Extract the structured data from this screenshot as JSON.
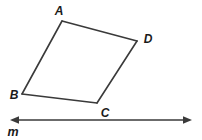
{
  "figure": {
    "type": "geometry-diagram",
    "background_color": "#ffffff",
    "stroke_color": "#3a3a3a",
    "label_color": "#1a1a1a",
    "quadrilateral": {
      "name": "quadrilateral-ABCD",
      "vertex_order": [
        "A",
        "B",
        "C",
        "D"
      ],
      "vertices": [
        {
          "id": "A",
          "label": "A",
          "x": 62,
          "y": 21,
          "label_x": 59,
          "label_y": 15,
          "label_anchor": "middle"
        },
        {
          "id": "B",
          "label": "B",
          "x": 22,
          "y": 94,
          "label_x": 14,
          "label_y": 99,
          "label_anchor": "middle"
        },
        {
          "id": "C",
          "label": "C",
          "x": 97,
          "y": 103,
          "label_x": 105,
          "label_y": 117,
          "label_anchor": "middle"
        },
        {
          "id": "D",
          "label": "D",
          "x": 137,
          "y": 41,
          "label_x": 148,
          "label_y": 43,
          "label_anchor": "middle"
        }
      ],
      "edges": [
        {
          "id": "AD",
          "from": "A",
          "to": "D"
        },
        {
          "id": "DC",
          "from": "D",
          "to": "C"
        },
        {
          "id": "CB",
          "from": "C",
          "to": "B"
        },
        {
          "id": "BA",
          "from": "B",
          "to": "A"
        }
      ],
      "stroke_width": 1.6
    },
    "line": {
      "name": "line-m",
      "label": "m",
      "label_x": 13,
      "label_y": 136,
      "x1": 11,
      "x2": 191,
      "y": 120,
      "stroke_width": 1.6,
      "arrowheads": [
        "left",
        "right"
      ]
    }
  }
}
